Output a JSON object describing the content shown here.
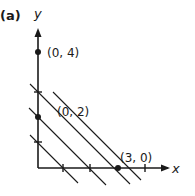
{
  "figure": {
    "panel_label": "(a)",
    "x_axis_label": "x",
    "y_axis_label": "y",
    "points": [
      {
        "label": "(0, 4)",
        "x": 0,
        "y": 4
      },
      {
        "label": "(0, 2)",
        "x": 0,
        "y": 2
      },
      {
        "label": "(3, 0)",
        "x": 3,
        "y": 0
      }
    ],
    "y_ticks": [
      1,
      3
    ],
    "x_ticks": [
      1,
      2,
      4
    ],
    "parallel_lines": [
      {
        "intercept_y": 1,
        "intercept_x": 1
      },
      {
        "intercept_y": 2,
        "intercept_x": 2
      },
      {
        "intercept_y": 3,
        "intercept_x": 3
      },
      {
        "intercept_y": 3.5,
        "intercept_x": 3.5
      }
    ],
    "colors": {
      "ink": "#1a1a1a",
      "background": "#ffffff"
    }
  }
}
